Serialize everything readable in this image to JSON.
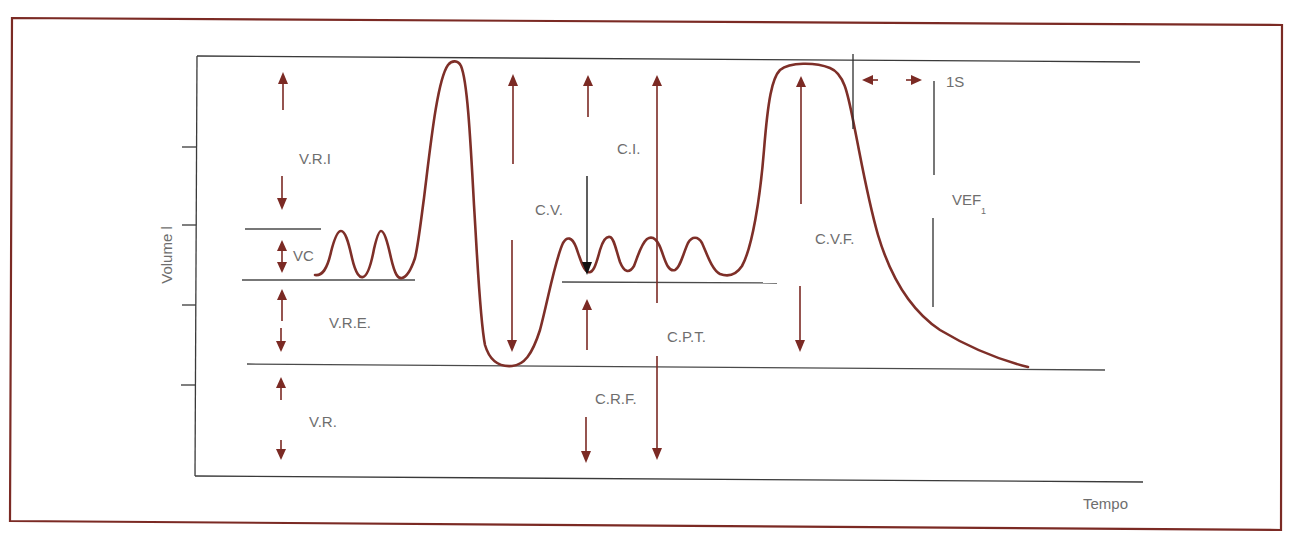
{
  "diagram": {
    "axes": {
      "y_label": "Volume l",
      "x_label": "Tempo"
    },
    "volumes": {
      "vri": "V.R.I",
      "vc": "VC",
      "vre": "V.R.E.",
      "vr": "V.R."
    },
    "capacities": {
      "cv": "C.V.",
      "ci": "C.I.",
      "cpt": "C.P.T.",
      "crf": "C.R.F.",
      "cvf": "C.V.F."
    },
    "forced": {
      "one_second": "1S",
      "vef_main": "VEF",
      "vef_sub": "1"
    },
    "colors": {
      "frame": "#7b2a24",
      "curve": "#7e2f28",
      "arrows": "#7b2a24",
      "text": "#6e6e6e",
      "lines": "#3a3a3a"
    }
  }
}
